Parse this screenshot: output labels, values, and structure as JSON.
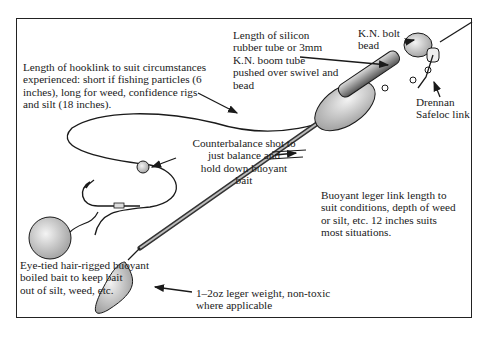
{
  "diagram": {
    "type": "fishing rig illustration",
    "labels": {
      "hooklink": "Length of hooklink to suit circumstances\nexperienced: short if fishing particles (6\ninches), long for weed, confidence rigs\nand silt (18 inches).",
      "silicon_tube": "Length of silicon\nrubber tube or 3mm\nK.N. boom tube\npushed over swivel and\nbead",
      "bolt_bead": "K.N. bolt\nbead",
      "safeloc": "Drennan\nSafeloc link",
      "counterbalance": "Counterbalance shot to\njust balance and\nhold down buoyant\nbait",
      "leger_link": "Buoyant leger link length to\nsuit conditions, depth of weed\nor silt, etc. 12 inches suits\nmost situations.",
      "bait": "Eye-tied hair-rigged buoyant\nboiled bait to keep bait\nout of silt, weed, etc.",
      "weight": "1–2oz leger weight, non-toxic\nwhere applicable"
    },
    "colors": {
      "ink": "#1a1a1a",
      "background": "#ffffff",
      "stipple": "#9a9a9a"
    }
  }
}
